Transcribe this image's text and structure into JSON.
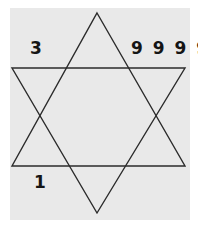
{
  "figure": {
    "background_color": "#ffffff",
    "plate_color": "#e9e9e9",
    "stroke_color": "#2b2b2b",
    "stroke_width": 1.4
  },
  "shape": {
    "name": "hexagram",
    "description": "Two overlapping equilateral triangles forming a six-pointed star",
    "triangle_up": {
      "apex": [
        97,
        13
      ],
      "base_left": [
        12,
        166
      ],
      "base_right": [
        185,
        166
      ]
    },
    "triangle_down": {
      "apex": [
        97,
        213
      ],
      "base_left": [
        12,
        68
      ],
      "base_right": [
        185,
        68
      ]
    }
  },
  "labels": {
    "upper_left": "3",
    "upper_right": "9 9 9 9",
    "lower_left": "1"
  }
}
